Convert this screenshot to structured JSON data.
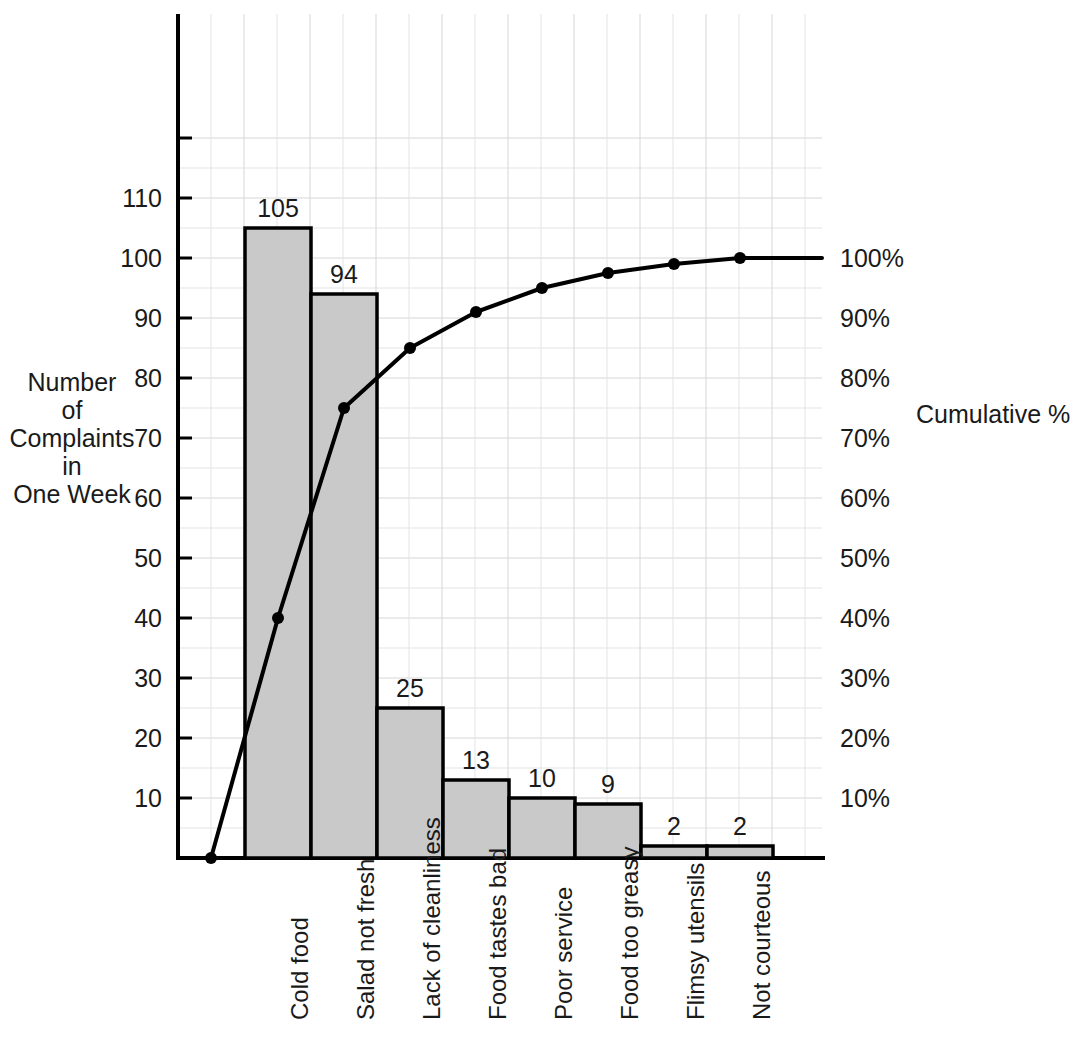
{
  "chart_data": {
    "type": "bar",
    "title": "",
    "subtitle": "",
    "xlabel": "",
    "ylabel": "Number of Complaints in One Week",
    "y2label": "Cumulative %",
    "grid": true,
    "legend": "none",
    "ylim": [
      0,
      120
    ],
    "y2lim": [
      0,
      120
    ],
    "categories": [
      "Cold food",
      "Salad not fresh",
      "Lack of cleanliness",
      "Food tastes bad",
      "Poor service",
      "Food too greasy",
      "Flimsy utensils",
      "Not courteous"
    ],
    "values": [
      105,
      94,
      25,
      13,
      10,
      9,
      2,
      2
    ],
    "bar_value_labels": [
      "105",
      "94",
      "25",
      "13",
      "10",
      "9",
      "2",
      "2"
    ],
    "total": 260,
    "series": [
      {
        "name": "Number of Complaints in One Week",
        "type": "bar",
        "values": [
          105,
          94,
          25,
          13,
          10,
          9,
          2,
          2
        ]
      },
      {
        "name": "Cumulative %",
        "type": "line",
        "axis": "right",
        "values": [
          40,
          75,
          85,
          91,
          95,
          97.5,
          99,
          100
        ],
        "start_at_zero": true
      }
    ],
    "yticks": [
      10,
      20,
      30,
      40,
      50,
      60,
      70,
      80,
      90,
      100,
      110
    ],
    "ytick_labels": [
      "10",
      "20",
      "30",
      "40",
      "50",
      "60",
      "70",
      "80",
      "90",
      "100",
      "110"
    ],
    "y2ticks": [
      10,
      20,
      30,
      40,
      50,
      60,
      70,
      80,
      90,
      100
    ],
    "y2tick_labels": [
      "10%",
      "20%",
      "30%",
      "40%",
      "50%",
      "60%",
      "70%",
      "80%",
      "90%",
      "100%"
    ]
  },
  "axis_titles": {
    "y_lines": [
      "Number",
      "of",
      "Complaints",
      "in",
      "One Week"
    ],
    "y2": "Cumulative %"
  },
  "colors": {
    "bar_fill": "#c9c9c9",
    "bar_stroke": "#000000",
    "line": "#000000",
    "marker": "#000000",
    "axis": "#000000",
    "grid": "#e3e3e3",
    "grid_major": "#d6d6d6",
    "text": "#1a1a1a",
    "background": "#ffffff"
  }
}
